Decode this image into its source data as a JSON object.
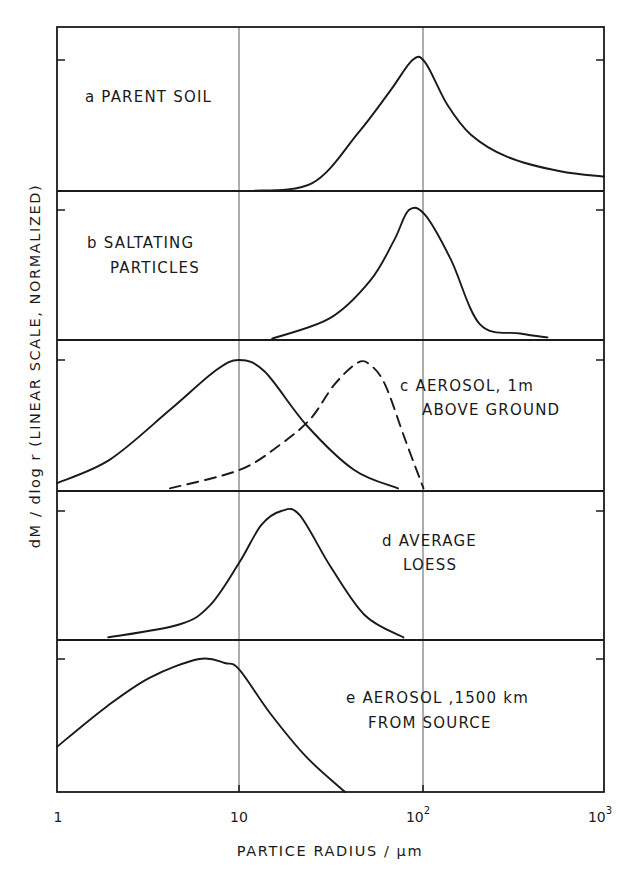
{
  "chart_data": {
    "type": "line",
    "title": "",
    "xlabel": "PARTICE RADIUS / µm",
    "ylabel": "dM / dlog r (LINEAR SCALE, NORMALIZED)",
    "xscale": "log",
    "xlim": [
      1,
      1000
    ],
    "x_ticks": [
      {
        "value": 1,
        "label": "1"
      },
      {
        "value": 10,
        "label": "10"
      },
      {
        "value": 100,
        "label": "10",
        "sup": "2"
      },
      {
        "value": 1000,
        "label": "10",
        "sup": "3"
      }
    ],
    "ylim": [
      0,
      1
    ],
    "grid": {
      "vertical_at": [
        10,
        100
      ]
    },
    "legend": null,
    "note": "Points given as [log10(radius µm), normalized dM/dlogr]; peak of each panel = 1.0",
    "panels": [
      {
        "id": "a",
        "label_lines": [
          "a PARENT SOIL"
        ],
        "series": [
          {
            "name": "Parent soil",
            "style": "solid",
            "points": [
              [
                1.06,
                0
              ],
              [
                1.4,
                0.06
              ],
              [
                1.65,
                0.44
              ],
              [
                1.83,
                0.77
              ],
              [
                1.95,
                1.0
              ],
              [
                2.02,
                0.98
              ],
              [
                2.14,
                0.66
              ],
              [
                2.27,
                0.43
              ],
              [
                2.47,
                0.26
              ],
              [
                2.76,
                0.15
              ],
              [
                3.0,
                0.11
              ]
            ]
          }
        ]
      },
      {
        "id": "b",
        "label_lines": [
          "b SALTATING",
          "PARTICLES"
        ],
        "series": [
          {
            "name": "Saltating particles",
            "style": "solid",
            "points": [
              [
                1.18,
                0.01
              ],
              [
                1.5,
                0.17
              ],
              [
                1.72,
                0.46
              ],
              [
                1.85,
                0.77
              ],
              [
                1.93,
                1.0
              ],
              [
                2.02,
                0.96
              ],
              [
                2.16,
                0.62
              ],
              [
                2.32,
                0.12
              ],
              [
                2.54,
                0.05
              ],
              [
                2.69,
                0.02
              ]
            ]
          }
        ]
      },
      {
        "id": "c",
        "label_lines": [
          "c AEROSOL, 1m",
          "ABOVE GROUND"
        ],
        "series": [
          {
            "name": "Aerosol 1 m above ground (solid)",
            "style": "solid",
            "points": [
              [
                0,
                0.06
              ],
              [
                0.29,
                0.24
              ],
              [
                0.62,
                0.62
              ],
              [
                0.87,
                0.92
              ],
              [
                1.0,
                1.0
              ],
              [
                1.14,
                0.91
              ],
              [
                1.37,
                0.5
              ],
              [
                1.63,
                0.16
              ],
              [
                1.87,
                0.02
              ]
            ]
          },
          {
            "name": "Aerosol 1 m above ground (dashed)",
            "style": "dashed",
            "points": [
              [
                0.62,
                0.02
              ],
              [
                1.0,
                0.16
              ],
              [
                1.22,
                0.35
              ],
              [
                1.39,
                0.55
              ],
              [
                1.52,
                0.81
              ],
              [
                1.65,
                0.98
              ],
              [
                1.72,
                0.96
              ],
              [
                1.8,
                0.81
              ],
              [
                1.91,
                0.39
              ],
              [
                2.01,
                0.02
              ]
            ]
          }
        ]
      },
      {
        "id": "d",
        "label_lines": [
          "d AVERAGE",
          "LOESS"
        ],
        "series": [
          {
            "name": "Average loess",
            "style": "solid",
            "points": [
              [
                0.28,
                0.02
              ],
              [
                0.67,
                0.12
              ],
              [
                0.84,
                0.27
              ],
              [
                1.0,
                0.6
              ],
              [
                1.12,
                0.89
              ],
              [
                1.23,
                1.0
              ],
              [
                1.33,
                0.97
              ],
              [
                1.5,
                0.57
              ],
              [
                1.69,
                0.19
              ],
              [
                1.9,
                0.02
              ]
            ]
          }
        ]
      },
      {
        "id": "e",
        "label_lines": [
          "e AEROSOL ,1500 km",
          "FROM SOURCE"
        ],
        "series": [
          {
            "name": "Aerosol 1500 km from source",
            "style": "solid",
            "points": [
              [
                0,
                0.34
              ],
              [
                0.27,
                0.64
              ],
              [
                0.51,
                0.86
              ],
              [
                0.78,
                1.0
              ],
              [
                0.92,
                0.97
              ],
              [
                1.0,
                0.92
              ],
              [
                1.17,
                0.59
              ],
              [
                1.37,
                0.26
              ],
              [
                1.58,
                0
              ]
            ]
          }
        ]
      }
    ]
  },
  "labels": {
    "x_axis_title": "PARTICE RADIUS / µm",
    "y_axis_title": "dM / dlog r (LINEAR SCALE, NORMALIZED)",
    "tick_1": "1",
    "tick_10": "10",
    "tick_100_base": "10",
    "tick_100_sup": "2",
    "tick_1000_base": "10",
    "tick_1000_sup": "3",
    "panel_a": [
      "a PARENT SOIL"
    ],
    "panel_b": [
      "b SALTATING",
      "PARTICLES"
    ],
    "panel_c": [
      "c AEROSOL, 1m",
      "ABOVE GROUND"
    ],
    "panel_d": [
      "d AVERAGE",
      "LOESS"
    ],
    "panel_e": [
      "e AEROSOL ,1500 km",
      "FROM SOURCE"
    ]
  }
}
